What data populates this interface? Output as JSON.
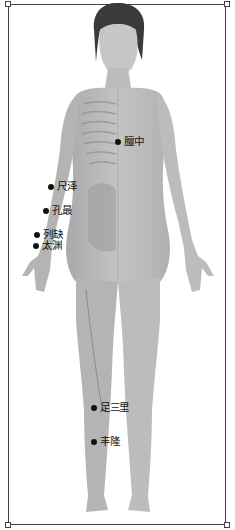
{
  "figure": {
    "colors": {
      "skin": "#b8b8b8",
      "skin_light": "#d4d4d4",
      "hair": "#3a3a3a",
      "frame": "#444444",
      "dot": "#111111"
    }
  },
  "acupoints": [
    {
      "label": "膻中",
      "x": 115,
      "y": 136
    },
    {
      "label": "尺泽",
      "x": 48,
      "y": 181
    },
    {
      "label": "孔最",
      "x": 43,
      "y": 205
    },
    {
      "label": "列缺",
      "x": 34,
      "y": 229
    },
    {
      "label": "太渊",
      "x": 33,
      "y": 240
    },
    {
      "label": "足三里",
      "x": 91,
      "y": 402
    },
    {
      "label": "丰隆",
      "x": 91,
      "y": 436
    }
  ]
}
